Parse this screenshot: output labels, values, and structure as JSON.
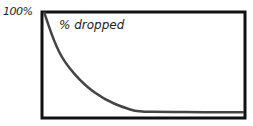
{
  "chart_data": {
    "type": "line",
    "title": "% dropped",
    "xlabel": "",
    "ylabel": "",
    "yticks": [
      "100%"
    ],
    "ylim": [
      0,
      100
    ],
    "grid": false,
    "legend": null,
    "series": [
      {
        "name": "% dropped",
        "x": [
          0,
          5,
          10,
          20,
          30,
          40,
          47,
          60,
          80,
          100
        ],
        "values": [
          100,
          72,
          52,
          30,
          16,
          8,
          4,
          4,
          3.5,
          3.5
        ]
      }
    ],
    "colors": {
      "line": "#444444",
      "frame": "#111111"
    }
  }
}
